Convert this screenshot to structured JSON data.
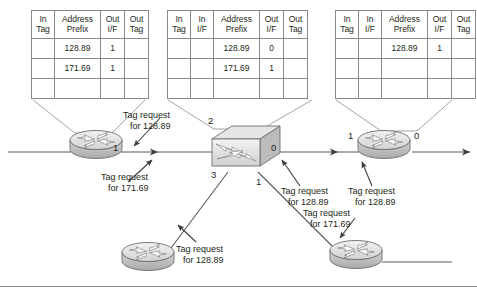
{
  "diagram": {
    "tables": [
      {
        "name": "left-router-tag-table",
        "headers": [
          "In Tag",
          "Address Prefix",
          "Out I/F",
          "Out Tag"
        ],
        "header_lines": [
          [
            "In",
            "Tag"
          ],
          [
            "Address",
            "Prefix"
          ],
          [
            "Out",
            "I/F"
          ],
          [
            "Out",
            "Tag"
          ]
        ],
        "rows": [
          {
            "in_tag": "",
            "prefix": "128.89",
            "out_if": "1",
            "out_tag": ""
          },
          {
            "in_tag": "",
            "prefix": "171.69",
            "out_if": "1",
            "out_tag": ""
          },
          {
            "in_tag": "",
            "prefix": "",
            "out_if": "",
            "out_tag": ""
          }
        ]
      },
      {
        "name": "switch-tag-table",
        "headers": [
          "In Tag",
          "In I/F",
          "Address Prefix",
          "Out I/F",
          "Out Tag"
        ],
        "header_lines": [
          [
            "In",
            "Tag"
          ],
          [
            "In",
            "I/F"
          ],
          [
            "Address",
            "Prefix"
          ],
          [
            "Out",
            "I/F"
          ],
          [
            "Out",
            "Tag"
          ]
        ],
        "rows": [
          {
            "in_tag": "",
            "in_if": "",
            "prefix": "128.89",
            "out_if": "0",
            "out_tag": ""
          },
          {
            "in_tag": "",
            "in_if": "",
            "prefix": "171.69",
            "out_if": "1",
            "out_tag": ""
          },
          {
            "in_tag": "",
            "in_if": "",
            "prefix": "",
            "out_if": "",
            "out_tag": ""
          }
        ]
      },
      {
        "name": "right-router-tag-table",
        "headers": [
          "In Tag",
          "In I/F",
          "Address Prefix",
          "Out I/F",
          "Out Tag"
        ],
        "header_lines": [
          [
            "In",
            "Tag"
          ],
          [
            "In",
            "I/F"
          ],
          [
            "Address",
            "Prefix"
          ],
          [
            "Out",
            "I/F"
          ],
          [
            "Out",
            "Tag"
          ]
        ],
        "rows": [
          {
            "in_tag": "",
            "in_if": "",
            "prefix": "128.89",
            "out_if": "1",
            "out_tag": ""
          },
          {
            "in_tag": "",
            "in_if": "",
            "prefix": "",
            "out_if": "",
            "out_tag": ""
          },
          {
            "in_tag": "",
            "in_if": "",
            "prefix": "",
            "out_if": "",
            "out_tag": ""
          }
        ]
      }
    ],
    "annotations": [
      {
        "name": "annotation-left-128",
        "line1": "Tag request",
        "line2": "for 128.89"
      },
      {
        "name": "annotation-left-171",
        "line1": "Tag request",
        "line2": "for 171.69"
      },
      {
        "name": "annotation-switch-128",
        "line1": "Tag request",
        "line2": "for 128.89"
      },
      {
        "name": "annotation-right-128",
        "line1": "Tag request",
        "line2": "for 128.89"
      },
      {
        "name": "annotation-bottom-171",
        "line1": "Tag request",
        "line2": "for 171.69"
      },
      {
        "name": "annotation-bottom-128",
        "line1": "Tag request",
        "line2": "for 128.89"
      }
    ],
    "port_labels": {
      "left_router_if1": "1",
      "switch_if2": "2",
      "switch_if3": "3",
      "switch_if0": "0",
      "switch_if1": "1",
      "right_router_if1": "1",
      "right_router_if0": "0"
    },
    "colors": {
      "line": "#58595b",
      "table_border": "#8a8a8a",
      "text": "#231f20",
      "device_fill": "#d9d9d9",
      "device_stroke": "#6d6e71",
      "background": "#ffffff"
    }
  }
}
